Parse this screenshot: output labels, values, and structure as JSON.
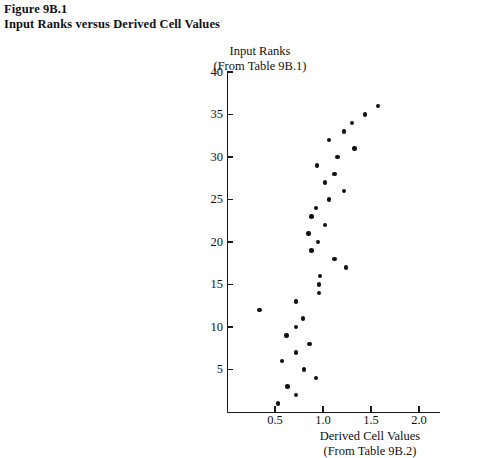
{
  "figure": {
    "label": "Figure 9B.1",
    "title": "Input Ranks versus Derived Cell Values"
  },
  "chart_data": {
    "type": "scatter",
    "title": "Input Ranks versus Derived Cell Values",
    "figure_label": "Figure 9B.1",
    "xlabel": "Derived Cell Values",
    "xlabel_line2": "(From Table 9B.2)",
    "ylabel": "Input Ranks",
    "ylabel_line2": "(From Table 9B.1)",
    "xlim": [
      0.0,
      2.08
    ],
    "ylim": [
      0,
      40
    ],
    "xticks": [
      0.5,
      1.0,
      1.5,
      2.0
    ],
    "xticklabels": [
      "0.5",
      "1.0",
      "1.5",
      "2.0"
    ],
    "yticks": [
      5,
      10,
      15,
      20,
      25,
      30,
      35,
      40
    ],
    "yticklabels": [
      "5",
      "10",
      "15",
      "20",
      "25",
      "30",
      "35",
      "40"
    ],
    "grid": false,
    "legend": null,
    "marker": "filled-circle",
    "marker_color": "#101010",
    "n_points": 36,
    "points": [
      {
        "x": 1.57,
        "y": 36
      },
      {
        "x": 1.44,
        "y": 35
      },
      {
        "x": 1.3,
        "y": 34
      },
      {
        "x": 1.22,
        "y": 33
      },
      {
        "x": 1.06,
        "y": 32
      },
      {
        "x": 1.33,
        "y": 31
      },
      {
        "x": 1.15,
        "y": 30
      },
      {
        "x": 0.94,
        "y": 29
      },
      {
        "x": 1.12,
        "y": 28
      },
      {
        "x": 1.02,
        "y": 27
      },
      {
        "x": 1.22,
        "y": 26
      },
      {
        "x": 1.06,
        "y": 25
      },
      {
        "x": 0.93,
        "y": 24
      },
      {
        "x": 0.88,
        "y": 23
      },
      {
        "x": 1.02,
        "y": 22
      },
      {
        "x": 0.85,
        "y": 21
      },
      {
        "x": 0.95,
        "y": 20
      },
      {
        "x": 0.88,
        "y": 19
      },
      {
        "x": 1.12,
        "y": 18
      },
      {
        "x": 1.24,
        "y": 17
      },
      {
        "x": 0.97,
        "y": 16
      },
      {
        "x": 0.96,
        "y": 15
      },
      {
        "x": 0.96,
        "y": 14
      },
      {
        "x": 0.72,
        "y": 13
      },
      {
        "x": 0.34,
        "y": 12
      },
      {
        "x": 0.79,
        "y": 11
      },
      {
        "x": 0.72,
        "y": 10
      },
      {
        "x": 0.62,
        "y": 9
      },
      {
        "x": 0.86,
        "y": 8
      },
      {
        "x": 0.72,
        "y": 7
      },
      {
        "x": 0.57,
        "y": 6
      },
      {
        "x": 0.8,
        "y": 5
      },
      {
        "x": 0.93,
        "y": 4
      },
      {
        "x": 0.63,
        "y": 3
      },
      {
        "x": 0.72,
        "y": 2
      },
      {
        "x": 0.53,
        "y": 1
      }
    ]
  }
}
